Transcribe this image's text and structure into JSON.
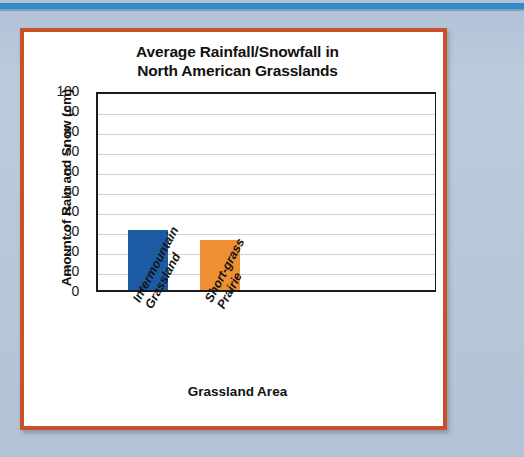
{
  "page": {
    "background_color": "#b9c9dc",
    "top_stripe_color": "#2f8cc9",
    "card_border_color": "#c8502a",
    "card_background": "#ffffff"
  },
  "chart_data": {
    "type": "bar",
    "title": "Average Rainfall/Snowfall in North American Grasslands",
    "title_lines": [
      "Average Rainfall/Snowfall in",
      "North American Grasslands"
    ],
    "xlabel": "Grassland Area",
    "ylabel": "Amount of Rain and Snow (cm)",
    "categories": [
      "Intermountain Grassland",
      "Short-grass Prairie"
    ],
    "category_lines": [
      [
        "Intermountain",
        "Grassland"
      ],
      [
        "Short-grass",
        "Prairie"
      ]
    ],
    "values": [
      30,
      25
    ],
    "bar_colors": [
      "#1c5ba4",
      "#ee8f33"
    ],
    "ylim": [
      0,
      100
    ],
    "ytick_step": 10,
    "yticks": [
      100,
      90,
      80,
      70,
      60,
      50,
      40,
      30,
      20,
      10,
      0
    ],
    "ytick_labels": [
      "100",
      "90",
      "80",
      "70",
      "60",
      "50",
      "40",
      "30",
      "20",
      "10",
      "0"
    ],
    "grid": true,
    "grid_color": "#d2d2d2",
    "axis_color": "#1a1a1a",
    "legend": false,
    "legend_position": "none"
  }
}
